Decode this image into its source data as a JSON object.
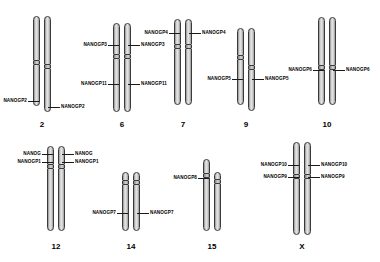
{
  "figure": {
    "background_color": "#ffffff",
    "outline_color": "#3a3a3a",
    "label_color": "#000000"
  },
  "chromosomes": [
    {
      "id": "chr2",
      "number": "2",
      "labels": [
        {
          "text": "NANOGP2",
          "side": "left"
        },
        {
          "text": "NANOGP2",
          "side": "right"
        }
      ]
    },
    {
      "id": "chr6",
      "number": "6",
      "labels": [
        {
          "text": "NANOGP3",
          "side": "left"
        },
        {
          "text": "NANOGP3",
          "side": "right"
        },
        {
          "text": "NANOGP11",
          "side": "left"
        },
        {
          "text": "NANOGP11",
          "side": "right"
        }
      ]
    },
    {
      "id": "chr7",
      "number": "7",
      "labels": [
        {
          "text": "NANOGP4",
          "side": "left"
        },
        {
          "text": "NANOGP4",
          "side": "right"
        }
      ]
    },
    {
      "id": "chr9",
      "number": "9",
      "labels": [
        {
          "text": "NANOGP5",
          "side": "left"
        },
        {
          "text": "NANOGP5",
          "side": "right"
        }
      ]
    },
    {
      "id": "chr10",
      "number": "10",
      "labels": [
        {
          "text": "NANOGP6",
          "side": "left"
        },
        {
          "text": "NANOGP6",
          "side": "right"
        }
      ]
    },
    {
      "id": "chr12",
      "number": "12",
      "labels": [
        {
          "text": "NANOG",
          "side": "left"
        },
        {
          "text": "NANOGP1",
          "side": "left"
        },
        {
          "text": "NANOG",
          "side": "right"
        },
        {
          "text": "NANOGP1",
          "side": "right"
        }
      ]
    },
    {
      "id": "chr14",
      "number": "14",
      "labels": [
        {
          "text": "NANOGP7",
          "side": "left"
        },
        {
          "text": "NANOGP7",
          "side": "right"
        }
      ]
    },
    {
      "id": "chr15",
      "number": "15",
      "labels": [
        {
          "text": "NANOGP8",
          "side": "left"
        }
      ]
    },
    {
      "id": "chrX",
      "number": "X",
      "labels": [
        {
          "text": "NANOGP10",
          "side": "left"
        },
        {
          "text": "NANOGP10",
          "side": "right"
        },
        {
          "text": "NANOGP9",
          "side": "left"
        },
        {
          "text": "NANOGP9",
          "side": "right"
        }
      ]
    }
  ]
}
